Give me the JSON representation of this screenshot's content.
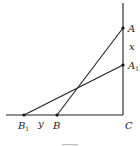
{
  "diagram": {
    "type": "geometry",
    "colors": {
      "line": "#222222",
      "point": "#111111",
      "label": "#1a1a1a",
      "background": "#ffffff"
    },
    "points": {
      "A": {
        "label": "A",
        "sub": "",
        "x": 123,
        "y": 28
      },
      "A1": {
        "label": "A",
        "sub": "1",
        "x": 123,
        "y": 65
      },
      "B": {
        "label": "B",
        "sub": "",
        "x": 57,
        "y": 115
      },
      "B1": {
        "label": "B",
        "sub": "1",
        "x": 24,
        "y": 115
      },
      "C": {
        "label": "C",
        "sub": "",
        "x": 123,
        "y": 115
      }
    },
    "segments": [
      {
        "name": "wall",
        "from": "top",
        "to": "C"
      },
      {
        "name": "ground",
        "from": "left",
        "to": "C"
      },
      {
        "name": "AB",
        "from": "A",
        "to": "B"
      },
      {
        "name": "A1B1",
        "from": "A1",
        "to": "B1"
      }
    ],
    "annotations": {
      "x_label": "x",
      "y_label": "y"
    }
  }
}
